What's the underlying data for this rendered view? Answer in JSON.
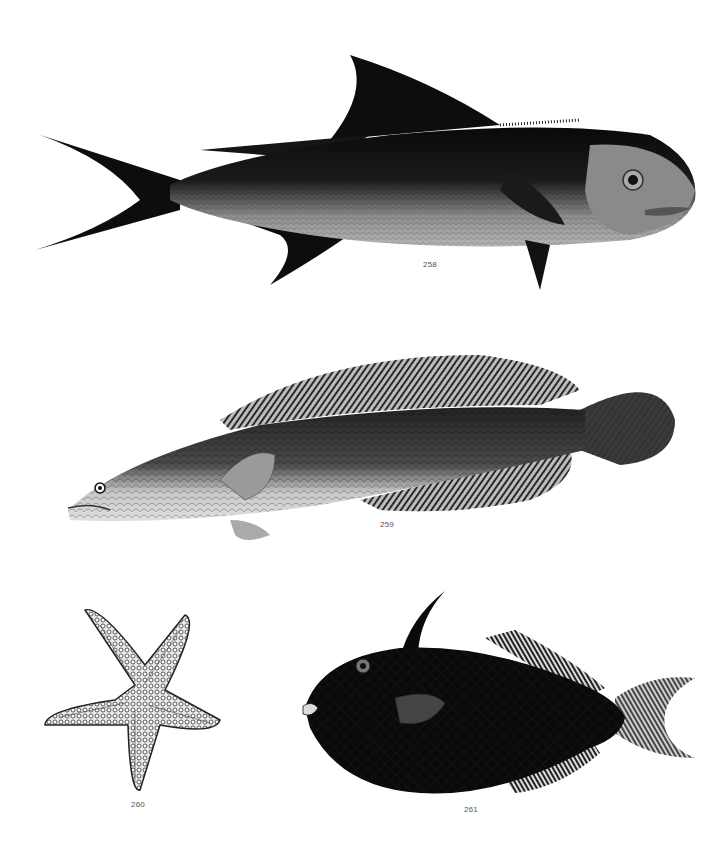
{
  "plate": {
    "background": "#ffffff",
    "figures": [
      {
        "number": "258",
        "subject": "dark-backed fish with forked tail and tall sickle dorsal fin",
        "ink": "#0d0d0d",
        "belly": "#9a9a9a"
      },
      {
        "number": "259",
        "subject": "elongate snakehead-like fish with long striped dorsal and anal fins, rounded tail, pale mottled flank",
        "ink": "#2a2a2a",
        "belly": "#d8d8d8"
      },
      {
        "number": "260",
        "subject": "five-armed starfish covered in granular tubercles",
        "ink": "#3a3a3a",
        "belly": "#e6e6e6"
      },
      {
        "number": "261",
        "subject": "dark deep-bodied filefish with curved dorsal spine and crescent tail",
        "ink": "#0a0a0a",
        "belly": "#5a5a5a"
      }
    ]
  }
}
